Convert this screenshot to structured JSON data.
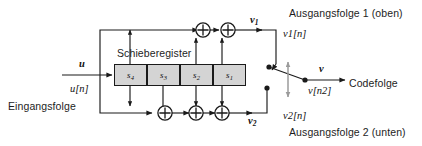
{
  "figure": {
    "kind": "convolutional-encoder-block-diagram",
    "register_title": "Schieberegister",
    "input": {
      "symbol": "u",
      "sequence": "u[n]",
      "caption": "Eingangsfolge"
    },
    "register_cells": [
      {
        "name": "s",
        "index": "4",
        "label": "s4"
      },
      {
        "name": "s",
        "index": "3",
        "label": "s3"
      },
      {
        "name": "s",
        "index": "2",
        "label": "s2"
      },
      {
        "name": "s",
        "index": "1",
        "label": "s1"
      }
    ],
    "outputs": [
      {
        "symbol": "v",
        "index": "1",
        "sequence": "v1[n]",
        "caption": "Ausgangsfolge 1 (oben)",
        "position": "top"
      },
      {
        "symbol": "v",
        "index": "2",
        "sequence": "v2[n]",
        "caption": "Ausgangsfolge 2 (unten)",
        "position": "bottom"
      }
    ],
    "code_output": {
      "symbol": "v",
      "sequence": "v[n2]",
      "caption": "Codefolge"
    },
    "adders": {
      "symbol": "+",
      "top_count": 2,
      "bottom_count": 3
    },
    "colors": {
      "line": "#1a1a1a",
      "register_fill": "#d4d4d4",
      "background": "#ffffff",
      "text": "#1d1d1d"
    }
  }
}
